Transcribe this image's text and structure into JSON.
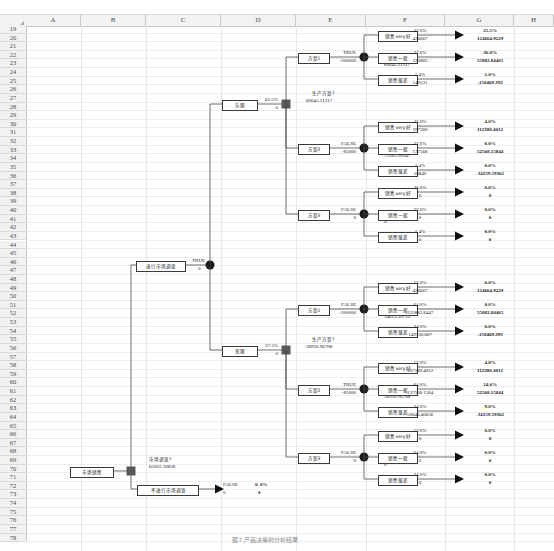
{
  "app": {
    "type": "spreadsheet",
    "columns": [
      "A",
      "B",
      "C",
      "D",
      "E",
      "F",
      "G",
      "H"
    ],
    "first_row": 19,
    "last_row": 78
  },
  "diagram": {
    "title_caption": "图7  产品决策树分析结果",
    "root": {
      "label": "市场销售",
      "decision_value": "65002.30838",
      "decision_caption": "市场调查?"
    },
    "branches": {
      "do_survey": {
        "label": "进行市场调查",
        "flag": "TRUE",
        "cost": "0"
      },
      "no_survey": {
        "label": "不进行市场调查",
        "flag": "FALSE",
        "cost": "0",
        "prob": "0. 0%",
        "payoff": "0"
      }
    },
    "survey_outcomes": [
      {
        "label": "乐观",
        "prob": "62.5%",
        "cost": "0",
        "caption": "生产方案?",
        "value": "80645.11317"
      },
      {
        "label": "悲观",
        "prob": "37.5%",
        "cost": "0",
        "caption": "生产方案?",
        "value": "38930.96708"
      }
    ],
    "plans": [
      {
        "label": "方案1",
        "flag": "TRUE",
        "cost": "-200000",
        "caption": "市场销售",
        "value": "80645.11317",
        "outcomes": [
          {
            "label": "销售very好",
            "prob_branch": "42.0%",
            "cost": "426667",
            "prob": "25.5%",
            "payoff": "124664.9229"
          },
          {
            "label": "销售一般",
            "prob_branch": "37.6%",
            "cost": "335883",
            "prob": "36.0%",
            "payoff": "55882.84465"
          },
          {
            "label": "销售很差",
            "prob_branch": "1.4%",
            "cost": "149531",
            "prob": "1.0%",
            "payoff": "-150469.392"
          }
        ]
      },
      {
        "label": "方案2",
        "flag": "FALSE",
        "cost": "-85000",
        "caption": "市场销售",
        "value": "75583.90947",
        "outcomes": [
          {
            "label": "销售very好",
            "prob_branch": "42.0%",
            "cost": "197380",
            "prob": "4.0%",
            "payoff": "112380.4012"
          },
          {
            "label": "销售一般",
            "prob_branch": "37.6%",
            "cost": "137568",
            "prob": "0.0%",
            "payoff": "52568.15844"
          },
          {
            "label": "销售很差",
            "prob_branch": "1.4%",
            "cost": "50840",
            "prob": "0.0%",
            "payoff": "-34159.59362"
          }
        ]
      },
      {
        "label": "方案3",
        "flag": "FALSE",
        "cost": "0",
        "caption": "市场销售",
        "value": "0",
        "outcomes": [
          {
            "label": "销售very好",
            "prob_branch": "40.0%",
            "cost": "0",
            "prob": "0.0%",
            "payoff": "0"
          },
          {
            "label": "销售一般",
            "prob_branch": "37.6%",
            "cost": "0",
            "prob": "0.0%",
            "payoff": "0"
          },
          {
            "label": "销售很差",
            "prob_branch": "1.4%",
            "cost": "0",
            "prob": "0.0%",
            "payoff": "0"
          }
        ]
      },
      {
        "label": "方案1",
        "flag": "FALSE",
        "cost": "-200000",
        "caption": "市场销售",
        "value": "14613.39712",
        "outcomes": [
          {
            "label": "销售very好",
            "prob_branch": "12.0%",
            "cost": "426667",
            "prob": "0.0%",
            "payoff": "124664.9229"
          },
          {
            "label": "销售一般",
            "prob_branch": "64.0%",
            "cost": "235882.8447",
            "prob": "0.0%",
            "payoff": "55882.84465"
          },
          {
            "label": "销售很差",
            "prob_branch": "24.0%",
            "cost": "149530.607",
            "prob": "0.0%",
            "payoff": "-150469.393"
          }
        ]
      },
      {
        "label": "方案2",
        "flag": "TRUE",
        "cost": "-85000",
        "caption": "市场销售",
        "value": "38930.96708",
        "outcomes": [
          {
            "label": "销售very好",
            "prob_branch": "12.0%",
            "cost": "197380.4012",
            "prob": "4.8%",
            "payoff": "112380.4012"
          },
          {
            "label": "销售一般",
            "prob_branch": "64.0%",
            "cost": "137568.1584",
            "prob": "24.0%",
            "payoff": "52568.15844"
          },
          {
            "label": "销售很差",
            "prob_branch": "24.0%",
            "cost": "50840.40636",
            "prob": "9.0%",
            "payoff": "-34159.59362"
          }
        ]
      },
      {
        "label": "方案3",
        "flag": "FALSE",
        "cost": "0",
        "caption": "市场销售",
        "value": "0",
        "outcomes": [
          {
            "label": "销售very好",
            "prob_branch": "12.0%",
            "cost": "0",
            "prob": "0.0%",
            "payoff": "0"
          },
          {
            "label": "销售一般",
            "prob_branch": "64.0%",
            "cost": "0",
            "prob": "0.0%",
            "payoff": "0"
          },
          {
            "label": "销售很差",
            "prob_branch": "24.0%",
            "cost": "0",
            "prob": "0.0%",
            "payoff": "0"
          }
        ]
      }
    ]
  },
  "colors": {
    "node_decision": "#595959",
    "node_chance": "#1a1a1a",
    "line": "#4a4a4a",
    "grid": "#e4e8ea",
    "header_bg": "#f2f2f2"
  }
}
